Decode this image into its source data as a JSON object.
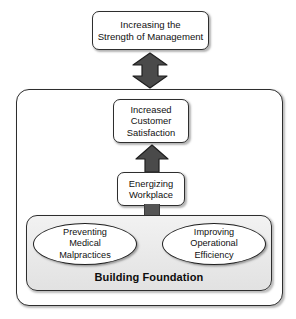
{
  "diagram": {
    "title_box": {
      "label": "Increasing the\nStrength of Management"
    },
    "outcome_box": {
      "label": "Increased\nCustomer\nSatisfaction"
    },
    "driver_box": {
      "label": "Energizing\nWorkplace"
    },
    "foundation": {
      "label": "Building Foundation",
      "items": [
        {
          "label": "Preventing\nMedical\nMalpractices"
        },
        {
          "label": "Improving\nOperational\nEfficiency"
        }
      ]
    },
    "connectors": [
      {
        "name": "bidirectional-arrow",
        "direction": "both"
      },
      {
        "name": "upward-arrow",
        "direction": "up"
      },
      {
        "name": "connector-bar",
        "direction": "up"
      }
    ],
    "colors": {
      "arrow_fill": "#4a4a4a",
      "arrow_stroke": "#1f1f1f",
      "box_stroke": "#2e2e2e",
      "foundation_fill": "#e9e9e9",
      "text": "#111111",
      "background": "#ffffff"
    }
  }
}
